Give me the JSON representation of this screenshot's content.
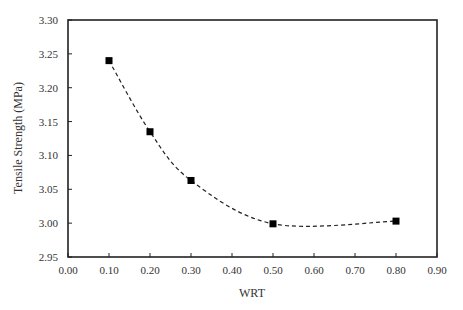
{
  "chart_data": {
    "type": "line",
    "title": "",
    "xlabel": "WRT",
    "ylabel": "Tensile Strength (MPa)",
    "xlim": [
      0.0,
      0.9
    ],
    "ylim": [
      2.95,
      3.3
    ],
    "xticks": [
      "0.00",
      "0.10",
      "0.20",
      "0.30",
      "0.40",
      "0.50",
      "0.60",
      "0.70",
      "0.80",
      "0.90"
    ],
    "yticks": [
      "2.95",
      "3.00",
      "3.05",
      "3.10",
      "3.15",
      "3.20",
      "3.25",
      "3.30"
    ],
    "grid": false,
    "legend": null,
    "series": [
      {
        "name": "Tensile Strength",
        "marker": "square",
        "line_style": "dashed-smooth",
        "color": "#000000",
        "x": [
          0.1,
          0.2,
          0.3,
          0.5,
          0.8
        ],
        "y": [
          3.24,
          3.135,
          3.063,
          2.999,
          3.003
        ]
      }
    ]
  },
  "colors": {
    "axis": "#222222",
    "marker": "#000000",
    "line": "#222222",
    "text": "#333333"
  }
}
